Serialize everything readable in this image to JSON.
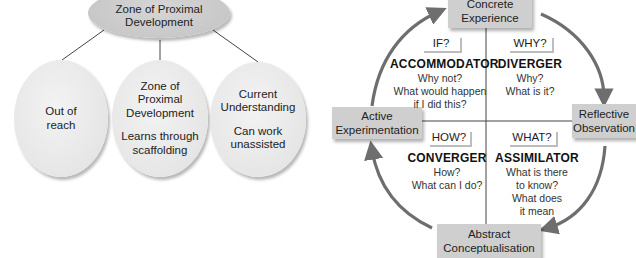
{
  "zpd_diagram": {
    "root": {
      "line1": "Zone of Proximal",
      "line2": "Development"
    },
    "children": [
      {
        "title": [
          "Out of",
          "reach"
        ],
        "subtitle": []
      },
      {
        "title": [
          "Zone of",
          "Proximal",
          "Development"
        ],
        "subtitle": [
          "Learns through",
          "scaffolding"
        ]
      },
      {
        "title": [
          "Current",
          "Understanding"
        ],
        "subtitle": [
          "Can work",
          "unassisted"
        ]
      }
    ]
  },
  "kolb_cycle": {
    "stages": {
      "top": [
        "Concrete",
        "Experience"
      ],
      "right": [
        "Reflective",
        "Observation"
      ],
      "bottom": [
        "Abstract",
        "Conceptualisation"
      ],
      "left": [
        "Active",
        "Experimentation"
      ]
    },
    "quadrants": [
      {
        "position": "top-left",
        "question": "IF?",
        "style": "ACCOMMODATOR",
        "description": [
          "Why not?",
          "What would happen",
          "if I did this?"
        ]
      },
      {
        "position": "top-right",
        "question": "WHY?",
        "style": "DIVERGER",
        "description": [
          "Why?",
          "What is it?"
        ]
      },
      {
        "position": "bottom-left",
        "question": "HOW?",
        "style": "CONVERGER",
        "description": [
          "How?",
          "What can I do?"
        ]
      },
      {
        "position": "bottom-right",
        "question": "WHAT?",
        "style": "ASSIMILATOR",
        "description": [
          "What is there",
          "to know?",
          "What does",
          "it mean"
        ]
      }
    ],
    "colors": {
      "arrow": "#6e6e6e",
      "stage_box": "#cfcfcf",
      "divider": "#444444"
    }
  }
}
